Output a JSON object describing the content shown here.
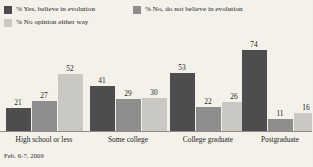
{
  "chart_data": {
    "type": "bar",
    "title": "",
    "subtitle": "",
    "xlabel": "",
    "ylabel": "",
    "ylim": [
      0,
      80
    ],
    "grid": false,
    "legend_position": "top-left",
    "categories": [
      "High school or less",
      "Some college",
      "College graduate",
      "Postgraduate"
    ],
    "series": [
      {
        "name": "% Yes, believe in evolution",
        "color": "#4d4d4d",
        "values": [
          21,
          41,
          53,
          74
        ]
      },
      {
        "name": "% No, do not believe in evolution",
        "color": "#8e8e8c",
        "values": [
          27,
          29,
          22,
          11
        ]
      },
      {
        "name": "% No opinion either way",
        "color": "#c9c8c2",
        "values": [
          52,
          30,
          26,
          16
        ]
      }
    ],
    "annotations": [
      "Feb. 6-7, 2009"
    ]
  },
  "legend": {
    "rows": [
      [
        {
          "label": "% Yes, believe in evolution",
          "color": "#4d4d4d"
        },
        {
          "label": "% No, do not believe in evolution",
          "color": "#8e8e8c"
        }
      ],
      [
        {
          "label": "% No opinion either way",
          "color": "#c9c8c2"
        }
      ]
    ]
  },
  "footnote": {
    "text": "Feb. 6-7, 2009"
  },
  "colors": {
    "background": "#f3f1ea",
    "axis": "#8d8c86",
    "text": "#1d1d1b",
    "series1": "#4d4d4d",
    "series2": "#8e8e8c",
    "series3": "#c9c8c2"
  }
}
